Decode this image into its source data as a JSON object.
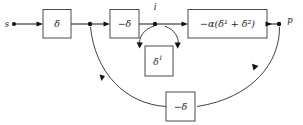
{
  "diagram": {
    "type": "signal-flow-block-diagram",
    "background_color": "#ffffff",
    "line_color": "#2b2b2b",
    "box_stroke_color": "#4a4a4a",
    "nodes": [
      {
        "id": "s",
        "label": "s",
        "x": 14,
        "y": 24,
        "label_x": 9,
        "label_y": 27
      },
      {
        "id": "branch",
        "label": "",
        "x": 90,
        "y": 24,
        "label_x": 90,
        "label_y": 24
      },
      {
        "id": "i",
        "label": "i",
        "x": 155,
        "y": 24,
        "label_x": 155,
        "label_y": 11
      },
      {
        "id": "p",
        "label": "p",
        "x": 279,
        "y": 24,
        "label_x": 291,
        "label_y": 25
      }
    ],
    "boxes": [
      {
        "id": "delta-box",
        "label": "δ",
        "x": 43,
        "y": 9,
        "w": 28,
        "h": 29
      },
      {
        "id": "neg-delta-box",
        "label": "−δ",
        "x": 110,
        "y": 9,
        "w": 29,
        "h": 29
      },
      {
        "id": "delta1-loop-box",
        "label": "δ",
        "superscript": "1",
        "x": 145,
        "y": 46,
        "w": 28,
        "h": 30
      },
      {
        "id": "alpha-box",
        "label": "−α(δ",
        "superscript_a": "1",
        "label_mid": " + δ",
        "superscript_b": "2",
        "label_end": ")",
        "full_label": "−α(δ¹ + δ²)",
        "x": 188,
        "y": 9,
        "w": 79,
        "h": 29
      },
      {
        "id": "feedback-neg-delta-box",
        "label": "−δ",
        "x": 166,
        "y": 92,
        "w": 29,
        "h": 29
      }
    ],
    "edges": [
      {
        "id": "s-to-delta",
        "from": "s",
        "to": "delta-box",
        "arrow": true
      },
      {
        "id": "delta-to-branch",
        "from": "delta-box",
        "to": "branch",
        "arrow": true
      },
      {
        "id": "branch-to-negdelta",
        "from": "branch",
        "to": "neg-delta-box",
        "arrow": true
      },
      {
        "id": "negdelta-to-i",
        "from": "neg-delta-box",
        "to": "i",
        "arrow": true
      },
      {
        "id": "i-to-alpha",
        "from": "i",
        "to": "alpha-box",
        "arrow": true
      },
      {
        "id": "alpha-to-p",
        "from": "alpha-box",
        "to": "p",
        "arrow": true
      },
      {
        "id": "i-selfloop-out",
        "from": "i",
        "to": "delta1-loop-box",
        "arrow": true,
        "style": "arc"
      },
      {
        "id": "delta1-loop-back",
        "from": "delta1-loop-box",
        "to": "i",
        "arrow": true,
        "style": "arc"
      },
      {
        "id": "p-to-feedback",
        "from": "p",
        "to": "feedback-neg-delta-box",
        "arrow": true,
        "style": "curve"
      },
      {
        "id": "feedback-to-branch",
        "from": "feedback-neg-delta-box",
        "to": "branch",
        "arrow": true,
        "style": "curve"
      }
    ]
  },
  "labels": {
    "source_node": "s",
    "output_node": "p",
    "intermediate_node": "i",
    "forward_gain": "δ",
    "inhibitory_gain": "−δ",
    "self_loop_gain": "δ¹",
    "transfer_function": "−α(δ¹ + δ²)",
    "feedback_gain": "−δ"
  }
}
